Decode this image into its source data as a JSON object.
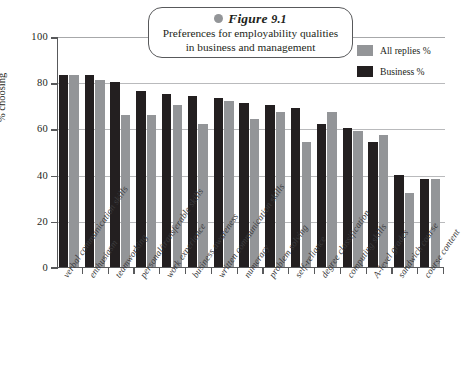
{
  "figure": {
    "marker_label": "Figure",
    "number": "9.1",
    "subtitle_line1": "Preferences for employability qualities",
    "subtitle_line2": "in business and management"
  },
  "legend": {
    "position": "top-right",
    "entries": [
      {
        "label": "All replies %",
        "color": "#939598",
        "key": "all"
      },
      {
        "label": "Business %",
        "color": "#231f20",
        "key": "business"
      }
    ]
  },
  "axes": {
    "ylabel": "% choosing",
    "yticks": [
      "0",
      "20",
      "40",
      "60",
      "80",
      "100"
    ],
    "ymin": 0,
    "ymax": 100
  },
  "chart_data": {
    "type": "bar",
    "title": "Preferences for employability qualities in business and management",
    "xlabel": "",
    "ylabel": "% choosing",
    "ylim": [
      0,
      100
    ],
    "grid": true,
    "legend_position": "top-right",
    "categories": [
      "verbal communication skills",
      "enthusiasm",
      "teamworking",
      "personal/transferable skills",
      "work experience",
      "business awareness",
      "written communication skills",
      "numeracy",
      "problem solving",
      "self-reliance",
      "degree classification",
      "computing skills",
      "A-level grades",
      "sandwich course",
      "course content"
    ],
    "series": [
      {
        "name": "Business %",
        "color": "#231f20",
        "values": [
          83,
          83,
          80,
          76,
          75,
          74,
          73,
          71,
          70,
          69,
          62,
          60,
          54,
          40,
          38
        ]
      },
      {
        "name": "All replies %",
        "color": "#939598",
        "values": [
          83,
          81,
          66,
          66,
          70,
          62,
          72,
          64,
          67,
          54,
          67,
          59,
          57,
          32,
          38
        ]
      }
    ]
  }
}
